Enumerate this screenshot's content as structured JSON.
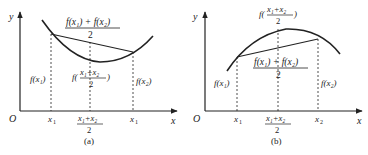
{
  "panels": [
    {
      "id": "a",
      "caption": "(a)",
      "type": "convex",
      "axis": {
        "origin": "O",
        "x_label": "x",
        "y_label": "y"
      },
      "x_ticks": {
        "x1": "x",
        "x1_sub": "1",
        "mid_num": "x₁+x₂",
        "mid_den": "2",
        "x2": "x",
        "x2_sub": "1"
      },
      "chord_label": {
        "num": "f(x₁) + f(x₂)",
        "den": "2"
      },
      "mid_label": {
        "prefix": "f(",
        "num": "x₁+x₂",
        "den": "2",
        "suffix": ")"
      },
      "fx1_label": "f(x₁)",
      "fx2_label": "f(x₂)"
    },
    {
      "id": "b",
      "caption": "(b)",
      "type": "concave",
      "axis": {
        "origin": "O",
        "x_label": "x",
        "y_label": "y"
      },
      "x_ticks": {
        "x1": "x",
        "x1_sub": "1",
        "mid_num": "x₁+x₂",
        "mid_den": "2",
        "x2": "x",
        "x2_sub": "2"
      },
      "chord_label": {
        "num": "f(x₁) + f(x₂)",
        "den": "2"
      },
      "mid_label": {
        "prefix": "f(",
        "num": "x₁+x₂",
        "den": "2",
        "suffix": ")"
      },
      "fx1_label": "f(x₁)",
      "fx2_label": "f(x₂)"
    }
  ],
  "colors": {
    "ink": "#222222",
    "background": "#ffffff"
  }
}
